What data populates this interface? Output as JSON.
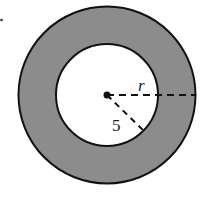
{
  "diagram": {
    "type": "annulus",
    "center": [
      107,
      95
    ],
    "outer_radius": 89,
    "inner_radius": 51,
    "ring_color": "#8c8c8c",
    "stroke_color": "#111111",
    "labels": {
      "outer_radius_label": "r",
      "inner_radius_label": "5"
    }
  }
}
